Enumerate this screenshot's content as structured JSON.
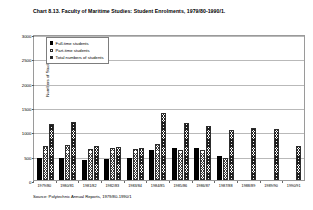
{
  "chart_data": {
    "type": "bar",
    "title": "Chart 8.13. Faculty of Maritime Studies: Student Enrolments, 1979/80-1990/1.",
    "xlabel": "",
    "ylabel": "Numbers of Students",
    "ylim": [
      0,
      3000
    ],
    "yticks": [
      0,
      500,
      1000,
      1500,
      2000,
      2500,
      3000
    ],
    "ytick_labels": [
      "0",
      "500",
      "1000",
      "1500",
      "2000",
      "2500",
      "3000"
    ],
    "grid": true,
    "legend_position": "top-left",
    "categories": [
      "1979/80",
      "1980/81",
      "1981/82",
      "1982/83",
      "1983/84",
      "1984/85",
      "1985/86",
      "1986/87",
      "1987/88",
      "1988/89",
      "1989/90",
      "1990/91"
    ],
    "series": [
      {
        "name": "Full-time students",
        "key": "ft",
        "values": [
          450,
          460,
          410,
          440,
          450,
          620,
          660,
          650,
          500,
          null,
          null,
          null
        ]
      },
      {
        "name": "Part-time students",
        "key": "pt",
        "values": [
          700,
          720,
          640,
          650,
          640,
          740,
          620,
          620,
          450,
          null,
          null,
          null
        ]
      },
      {
        "name": "Total numbers of students",
        "key": "tot",
        "values": [
          1150,
          1190,
          690,
          670,
          660,
          1370,
          1180,
          1100,
          1020,
          1060,
          1050,
          690
        ]
      }
    ],
    "source": "Source: Polytechnic Annual Reports, 1979/80-1990/1"
  },
  "legend": {
    "items": [
      {
        "label": "Full-time students",
        "key": "ft"
      },
      {
        "label": "Part-time students",
        "key": "pt"
      },
      {
        "label": "Total numbers of students",
        "key": "tot"
      }
    ]
  }
}
